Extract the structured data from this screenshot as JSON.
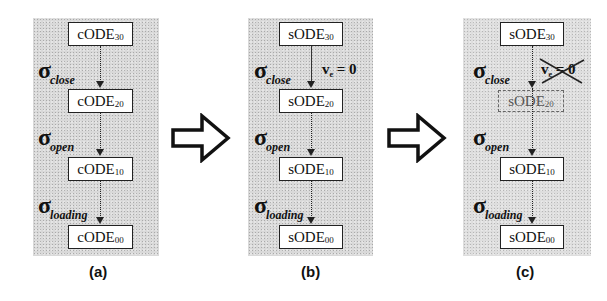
{
  "diagram": {
    "panels": [
      {
        "id": "a",
        "caption": "(a)",
        "nodes": [
          {
            "prefix": "cODE",
            "sub": "30"
          },
          {
            "prefix": "cODE",
            "sub": "20"
          },
          {
            "prefix": "cODE",
            "sub": "10"
          },
          {
            "prefix": "cODE",
            "sub": "00"
          }
        ],
        "transitions": [
          {
            "symbol": "σ",
            "sub": "close"
          },
          {
            "symbol": "σ",
            "sub": "open"
          },
          {
            "symbol": "σ",
            "sub": "loading"
          }
        ]
      },
      {
        "id": "b",
        "caption": "(b)",
        "nodes": [
          {
            "prefix": "sODE",
            "sub": "30"
          },
          {
            "prefix": "sODE",
            "sub": "20"
          },
          {
            "prefix": "sODE",
            "sub": "10"
          },
          {
            "prefix": "sODE",
            "sub": "00"
          }
        ],
        "transitions": [
          {
            "symbol": "σ",
            "sub": "close"
          },
          {
            "symbol": "σ",
            "sub": "open"
          },
          {
            "symbol": "σ",
            "sub": "loading"
          }
        ],
        "condition": {
          "var": "v",
          "sub": "e",
          "rest": " = 0"
        }
      },
      {
        "id": "c",
        "caption": "(c)",
        "nodes": [
          {
            "prefix": "sODE",
            "sub": "30"
          },
          {
            "prefix": "sODE",
            "sub": "20",
            "removed": true
          },
          {
            "prefix": "sODE",
            "sub": "10"
          },
          {
            "prefix": "sODE",
            "sub": "00"
          }
        ],
        "transitions": [
          {
            "symbol": "σ",
            "sub": "close"
          },
          {
            "symbol": "σ",
            "sub": "open"
          },
          {
            "symbol": "σ",
            "sub": "loading"
          }
        ],
        "condition": {
          "var": "v",
          "sub": "e",
          "rest": " = 0",
          "crossed_out": true
        }
      }
    ],
    "transform_arrows": [
      "hollow-right-arrow",
      "hollow-right-arrow"
    ]
  }
}
